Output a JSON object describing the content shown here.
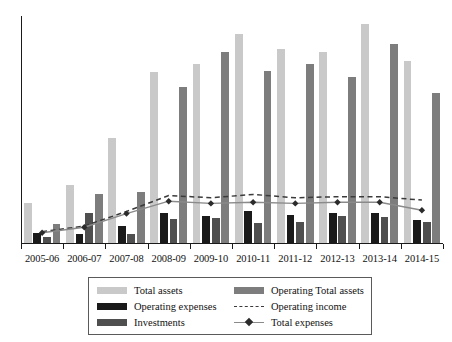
{
  "chart_data": {
    "type": "bar",
    "title": "",
    "subtitle": "",
    "xlabel": "",
    "ylabel": "",
    "grid": false,
    "legend_position": "bottom",
    "ylim": [
      0,
      100
    ],
    "categories": [
      "2005-06",
      "2006-07",
      "2007-08",
      "2008-09",
      "2009-10",
      "2010-11",
      "2011-12",
      "2012-13",
      "2013-14",
      "2014-15"
    ],
    "series": [
      {
        "name": "Total assets",
        "type": "bar",
        "color": "#c9c9c9",
        "values": [
          17.5,
          25.5,
          46.5,
          75.5,
          79.0,
          92.5,
          86.0,
          84.5,
          97.0,
          80.5
        ]
      },
      {
        "name": "Operating expenses",
        "type": "bar",
        "color": "#1a1a1a",
        "values": [
          4.5,
          4.0,
          7.5,
          13.5,
          12.0,
          14.0,
          12.5,
          13.5,
          13.5,
          10.0
        ]
      },
      {
        "name": "Investments",
        "type": "bar",
        "color": "#4f4f4f",
        "values": [
          2.5,
          13.5,
          4.0,
          10.5,
          11.0,
          9.0,
          9.5,
          12.0,
          11.5,
          9.5
        ]
      },
      {
        "name": "Operating Total assets",
        "type": "bar",
        "color": "#7d7d7d",
        "values": [
          8.5,
          21.5,
          22.5,
          69.0,
          84.5,
          76.0,
          79.0,
          73.5,
          88.0,
          66.5
        ]
      },
      {
        "name": "Operating income",
        "type": "line",
        "style": "dashed",
        "color": "#3b3b3b",
        "values": [
          5.0,
          7.5,
          14.0,
          21.0,
          20.0,
          21.5,
          20.0,
          20.5,
          20.5,
          19.0
        ]
      },
      {
        "name": "Total expenses",
        "type": "line",
        "style": "solid-marker",
        "color": "#8a8a8a",
        "marker": "diamond",
        "values": [
          4.5,
          7.0,
          13.0,
          18.5,
          17.5,
          18.0,
          17.5,
          18.0,
          18.0,
          14.5
        ]
      }
    ],
    "legend": [
      {
        "label": "Total assets",
        "kind": "swatch",
        "color": "#c9c9c9"
      },
      {
        "label": "Operating Total assets",
        "kind": "swatch",
        "color": "#7d7d7d"
      },
      {
        "label": "Operating expenses",
        "kind": "swatch",
        "color": "#1a1a1a"
      },
      {
        "label": "Operating income",
        "kind": "dashed-line",
        "color": "#3b3b3b"
      },
      {
        "label": "Investments",
        "kind": "swatch",
        "color": "#4f4f4f"
      },
      {
        "label": "Total expenses",
        "kind": "marker-line",
        "color": "#8a8a8a"
      }
    ]
  }
}
